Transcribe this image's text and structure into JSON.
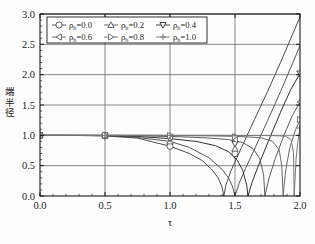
{
  "chart_data": {
    "type": "line",
    "title": "",
    "xlabel": "τ",
    "ylabel": "端半径",
    "xlim": [
      0.0,
      2.0
    ],
    "ylim": [
      0.0,
      3.0
    ],
    "xticks": [
      "0.0",
      "0.5",
      "1.0",
      "1.5",
      "2.0"
    ],
    "xtick_values": [
      0.0,
      0.5,
      1.0,
      1.5,
      2.0
    ],
    "yticks": [
      "0.0",
      "0.5",
      "1.0",
      "1.5",
      "2.0",
      "2.5",
      "3.0"
    ],
    "ytick_values": [
      0.0,
      0.5,
      1.0,
      1.5,
      2.0,
      2.5,
      3.0
    ],
    "grid": true,
    "legend_position": "upper-left",
    "series": [
      {
        "name": "ρb=0.0",
        "label_base": "ρ",
        "label_sub": "b",
        "label_value": "=0.0",
        "marker": "circle",
        "color": "#4a4a4a",
        "marker_x": [
          0.0,
          0.5,
          1.0,
          1.5
        ],
        "marker_y": [
          1.0,
          0.99,
          0.82,
          0.7
        ],
        "cusp_tau": 1.414,
        "end_value": 3.0,
        "x": [
          0.0,
          0.25,
          0.5,
          0.75,
          1.0,
          1.15,
          1.25,
          1.32,
          1.37,
          1.4,
          1.414,
          1.43,
          1.47,
          1.55,
          1.65,
          1.75,
          1.85,
          1.95,
          2.0
        ],
        "y": [
          1.0,
          0.998,
          0.99,
          0.955,
          0.82,
          0.7,
          0.58,
          0.44,
          0.3,
          0.15,
          0.0,
          0.18,
          0.42,
          0.8,
          1.26,
          1.72,
          2.2,
          2.7,
          2.95
        ]
      },
      {
        "name": "ρb=0.2",
        "label_base": "ρ",
        "label_sub": "b",
        "label_value": "=0.2",
        "marker": "triangle-up",
        "color": "#555555",
        "marker_x": [
          0.0,
          0.5,
          1.0,
          1.5
        ],
        "marker_y": [
          1.0,
          0.995,
          0.9,
          0.78
        ],
        "cusp_tau": 1.5,
        "end_value": 2.5,
        "x": [
          0.0,
          0.25,
          0.5,
          0.75,
          1.0,
          1.15,
          1.3,
          1.4,
          1.45,
          1.48,
          1.5,
          1.53,
          1.58,
          1.66,
          1.75,
          1.85,
          1.93,
          2.0
        ],
        "y": [
          1.0,
          0.999,
          0.995,
          0.965,
          0.9,
          0.8,
          0.63,
          0.44,
          0.3,
          0.16,
          0.0,
          0.2,
          0.45,
          0.82,
          1.24,
          1.72,
          2.12,
          2.48
        ]
      },
      {
        "name": "ρb=0.4",
        "label_base": "ρ",
        "label_sub": "b",
        "label_value": "=0.4",
        "marker": "triangle-down",
        "color": "#2e2e2e",
        "marker_x": [
          0.0,
          0.5,
          1.0,
          1.5,
          2.0
        ],
        "marker_y": [
          1.0,
          0.998,
          0.945,
          0.86,
          2.02
        ],
        "cusp_tau": 1.6,
        "end_value": 2.02,
        "x": [
          0.0,
          0.25,
          0.5,
          0.75,
          1.0,
          1.2,
          1.35,
          1.45,
          1.52,
          1.56,
          1.59,
          1.6,
          1.63,
          1.68,
          1.76,
          1.85,
          1.93,
          2.0
        ],
        "y": [
          1.0,
          1.0,
          0.998,
          0.982,
          0.945,
          0.9,
          0.83,
          0.73,
          0.58,
          0.42,
          0.18,
          0.0,
          0.22,
          0.5,
          0.92,
          1.38,
          1.76,
          2.02
        ]
      },
      {
        "name": "ρb=0.6",
        "label_base": "ρ",
        "label_sub": "b",
        "label_value": "=0.6",
        "marker": "triangle-left",
        "color": "#5c5c5c",
        "marker_x": [
          0.0,
          0.5,
          1.0,
          1.5,
          2.0
        ],
        "marker_y": [
          1.0,
          1.0,
          0.975,
          0.93,
          1.55
        ],
        "cusp_tau": 1.73,
        "end_value": 1.55,
        "x": [
          0.0,
          0.3,
          0.6,
          0.9,
          1.1,
          1.3,
          1.45,
          1.56,
          1.64,
          1.69,
          1.72,
          1.73,
          1.76,
          1.81,
          1.88,
          1.94,
          2.0
        ],
        "y": [
          1.0,
          1.0,
          1.0,
          0.985,
          0.975,
          0.955,
          0.93,
          0.88,
          0.78,
          0.62,
          0.35,
          0.0,
          0.28,
          0.62,
          1.02,
          1.32,
          1.55
        ]
      },
      {
        "name": "ρb=0.8",
        "label_base": "ρ",
        "label_sub": "b",
        "label_value": "=0.8",
        "marker": "triangle-right",
        "color": "#6a6a6a",
        "marker_x": [
          0.0,
          0.5,
          1.0,
          1.5,
          2.0
        ],
        "marker_y": [
          1.0,
          1.0,
          0.995,
          0.975,
          1.26
        ],
        "cusp_tau": 1.87,
        "end_value": 1.26,
        "x": [
          0.0,
          0.4,
          0.8,
          1.1,
          1.35,
          1.55,
          1.7,
          1.79,
          1.84,
          1.86,
          1.87,
          1.89,
          1.92,
          1.96,
          2.0
        ],
        "y": [
          1.0,
          1.0,
          1.0,
          0.995,
          0.99,
          0.98,
          0.96,
          0.9,
          0.76,
          0.5,
          0.0,
          0.42,
          0.78,
          1.06,
          1.26
        ]
      },
      {
        "name": "ρb=1.0",
        "label_base": "ρ",
        "label_sub": "b",
        "label_value": "=1.0",
        "marker": "plus",
        "color": "#787878",
        "marker_x": [
          0.0,
          0.5,
          1.0,
          1.5,
          2.0
        ],
        "marker_y": [
          1.0,
          1.0,
          1.0,
          0.995,
          1.12
        ],
        "cusp_tau": 1.955,
        "end_value": 1.12,
        "x": [
          0.0,
          0.5,
          1.0,
          1.4,
          1.65,
          1.8,
          1.89,
          1.93,
          1.95,
          1.955,
          1.97,
          1.985,
          2.0
        ],
        "y": [
          1.0,
          1.0,
          1.0,
          0.999,
          0.997,
          0.995,
          0.985,
          0.93,
          0.72,
          0.0,
          0.62,
          0.92,
          1.12
        ]
      }
    ]
  },
  "legend": {
    "rows": [
      [
        "ρb=0.0",
        "ρb=0.2",
        "ρb=0.4"
      ],
      [
        "ρb=0.6",
        "ρb=0.8",
        "ρb=1.0"
      ]
    ]
  },
  "axes": {
    "x_title": "τ",
    "y_title": "端半径",
    "y_title_chars": [
      "端",
      "半",
      "径"
    ]
  },
  "colors": {
    "axis": "#1a1a1a",
    "grid": "#555555",
    "background": "#fdfdfd",
    "legend_border": "#1a1a1a"
  }
}
